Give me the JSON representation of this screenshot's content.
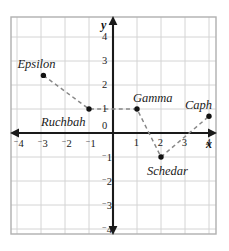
{
  "figure": {
    "type": "coordinate-plane-scatter",
    "background": "#ffffff",
    "grid_color": "#d4d4d4",
    "border_color": "#b0b0b0",
    "axis_color": "#1a1a1a",
    "point_color": "#111111",
    "dash_color": "#888888"
  },
  "axes": {
    "x_name": "x",
    "y_name": "y",
    "x_range": [
      -4.6,
      4.6
    ],
    "y_range": [
      -4.6,
      4.6
    ],
    "origin_label": "0",
    "x_ticks": [
      {
        "value": -4,
        "label": "4",
        "negative": true
      },
      {
        "value": -3,
        "label": "3",
        "negative": true
      },
      {
        "value": -2,
        "label": "2",
        "negative": true
      },
      {
        "value": -1,
        "label": "1",
        "negative": true
      },
      {
        "value": 1,
        "label": "1",
        "negative": false
      },
      {
        "value": 2,
        "label": "2",
        "negative": false
      },
      {
        "value": 3,
        "label": "3",
        "negative": false
      },
      {
        "value": 4,
        "label": "4",
        "negative": false
      }
    ],
    "y_ticks": [
      {
        "value": 4,
        "label": "4",
        "negative": false
      },
      {
        "value": 3,
        "label": "3",
        "negative": false
      },
      {
        "value": 2,
        "label": "2",
        "negative": false
      },
      {
        "value": 1,
        "label": "1",
        "negative": false
      },
      {
        "value": -1,
        "label": "1",
        "negative": true
      },
      {
        "value": -2,
        "label": "2",
        "negative": true
      },
      {
        "value": -3,
        "label": "3",
        "negative": true
      },
      {
        "value": -4,
        "label": "4",
        "negative": true
      }
    ]
  },
  "chart_data": {
    "type": "scatter",
    "title": "",
    "xlabel": "x",
    "ylabel": "y",
    "xlim": [
      -4.6,
      4.6
    ],
    "ylim": [
      -4.6,
      4.6
    ],
    "grid": true,
    "legend": "none",
    "points": [
      {
        "name": "Epsilon",
        "x": -2.9,
        "y": 2.4,
        "label_dx": -26,
        "label_dy": -17
      },
      {
        "name": "Ruchbah",
        "x": -1.0,
        "y": 1.0,
        "label_dx": -48,
        "label_dy": 7
      },
      {
        "name": "Gamma",
        "x": 1.0,
        "y": 1.0,
        "label_dx": -4,
        "label_dy": -17
      },
      {
        "name": "Schedar",
        "x": 2.0,
        "y": -1.0,
        "label_dx": -14,
        "label_dy": 8
      },
      {
        "name": "Caph",
        "x": 4.0,
        "y": 0.7,
        "label_dx": -24,
        "label_dy": -17
      }
    ],
    "path": [
      "Epsilon",
      "Ruchbah",
      "Gamma",
      "Schedar",
      "Caph"
    ],
    "path_style": "dashed"
  }
}
